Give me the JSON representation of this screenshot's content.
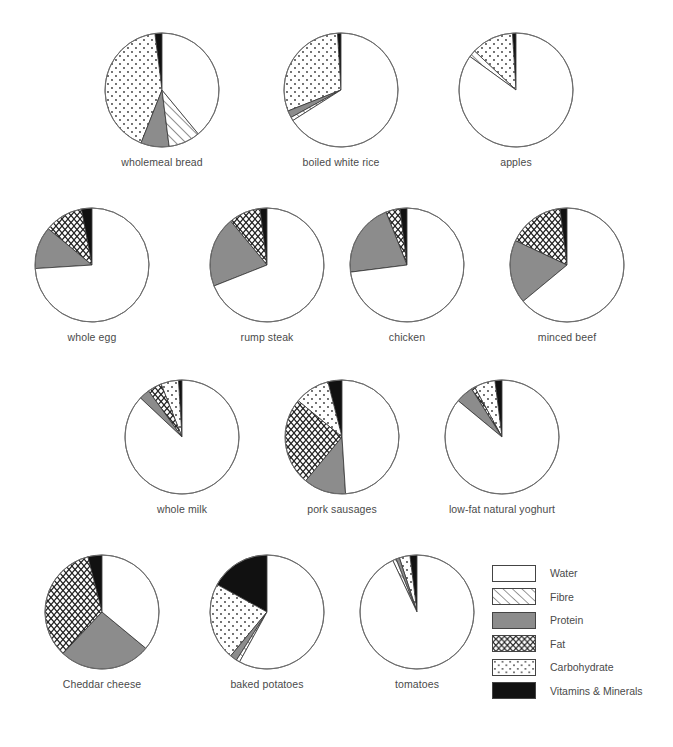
{
  "chart_data": {
    "type": "pie",
    "title": "",
    "subtitle": "",
    "xlabel": "",
    "ylabel": "",
    "legend_position": "bottom-right",
    "grid": false,
    "value_unit": "percent of composition by weight",
    "categories": [
      "Water",
      "Fibre",
      "Protein",
      "Fat",
      "Carbohydrate",
      "Vitamins & Minerals"
    ],
    "category_fills": {
      "Water": "#ffffff",
      "Fibre": "diagonal-hatch",
      "Protein": "#8c8c8c",
      "Fat": "zigzag-hatch",
      "Carbohydrate": "dotted",
      "Vitamins & Minerals": "#111111"
    },
    "slice_order": [
      "Vitamins & Minerals",
      "Carbohydrate",
      "Fat",
      "Protein",
      "Fibre",
      "Water"
    ],
    "start_angle_deg": 0,
    "direction": "counter-clockwise",
    "charts": [
      {
        "label": "wholemeal bread",
        "values": {
          "Vitamins & Minerals": 2,
          "Carbohydrate": 42,
          "Fat": 0,
          "Protein": 8,
          "Fibre": 9,
          "Water": 39
        }
      },
      {
        "label": "boiled white rice",
        "values": {
          "Vitamins & Minerals": 1,
          "Carbohydrate": 30,
          "Fat": 0,
          "Protein": 2,
          "Fibre": 1,
          "Water": 66
        }
      },
      {
        "label": "apples",
        "values": {
          "Vitamins & Minerals": 1,
          "Carbohydrate": 12,
          "Fat": 0,
          "Protein": 0,
          "Fibre": 2,
          "Water": 85
        }
      },
      {
        "label": "whole egg",
        "values": {
          "Vitamins & Minerals": 3,
          "Carbohydrate": 0,
          "Fat": 11,
          "Protein": 12,
          "Fibre": 0,
          "Water": 74
        }
      },
      {
        "label": "rump steak",
        "values": {
          "Vitamins & Minerals": 2,
          "Carbohydrate": 0,
          "Fat": 9,
          "Protein": 20,
          "Fibre": 0,
          "Water": 69
        }
      },
      {
        "label": "chicken",
        "values": {
          "Vitamins & Minerals": 2,
          "Carbohydrate": 0,
          "Fat": 4,
          "Protein": 21,
          "Fibre": 0,
          "Water": 73
        }
      },
      {
        "label": "minced beef",
        "values": {
          "Vitamins & Minerals": 2,
          "Carbohydrate": 0,
          "Fat": 16,
          "Protein": 18,
          "Fibre": 0,
          "Water": 64
        }
      },
      {
        "label": "whole milk",
        "values": {
          "Vitamins & Minerals": 1,
          "Carbohydrate": 5,
          "Fat": 4,
          "Protein": 3,
          "Fibre": 0,
          "Water": 87
        }
      },
      {
        "label": "pork sausages",
        "values": {
          "Vitamins & Minerals": 4,
          "Carbohydrate": 10,
          "Fat": 25,
          "Protein": 12,
          "Fibre": 0,
          "Water": 49
        }
      },
      {
        "label": "low-fat natural yoghurt",
        "values": {
          "Vitamins & Minerals": 2,
          "Carbohydrate": 6,
          "Fat": 1,
          "Protein": 5,
          "Fibre": 0,
          "Water": 86
        }
      },
      {
        "label": "Cheddar cheese",
        "values": {
          "Vitamins & Minerals": 4,
          "Carbohydrate": 0,
          "Fat": 34,
          "Protein": 26,
          "Fibre": 0,
          "Water": 36
        }
      },
      {
        "label": "baked potatoes",
        "values": {
          "Vitamins & Minerals": 17,
          "Carbohydrate": 22,
          "Fat": 0,
          "Protein": 2,
          "Fibre": 1,
          "Water": 58
        }
      },
      {
        "label": "tomatoes",
        "values": {
          "Vitamins & Minerals": 2,
          "Carbohydrate": 3,
          "Fat": 0,
          "Protein": 1,
          "Fibre": 1,
          "Water": 93
        }
      }
    ]
  },
  "layout": {
    "positions": [
      {
        "x": 102,
        "y": 30
      },
      {
        "x": 281,
        "y": 30
      },
      {
        "x": 456,
        "y": 30
      },
      {
        "x": 32,
        "y": 205
      },
      {
        "x": 207,
        "y": 205
      },
      {
        "x": 347,
        "y": 205
      },
      {
        "x": 507,
        "y": 205
      },
      {
        "x": 122,
        "y": 377
      },
      {
        "x": 282,
        "y": 377
      },
      {
        "x": 442,
        "y": 377
      },
      {
        "x": 42,
        "y": 552
      },
      {
        "x": 207,
        "y": 552
      },
      {
        "x": 357,
        "y": 552
      }
    ]
  },
  "legend": {
    "items": [
      {
        "label": "Water",
        "fill": "water"
      },
      {
        "label": "Fibre",
        "fill": "fibre"
      },
      {
        "label": "Protein",
        "fill": "protein"
      },
      {
        "label": "Fat",
        "fill": "fat"
      },
      {
        "label": "Carbohydrate",
        "fill": "carbohydrate"
      },
      {
        "label": "Vitamins & Minerals",
        "fill": "vitamins"
      }
    ]
  }
}
